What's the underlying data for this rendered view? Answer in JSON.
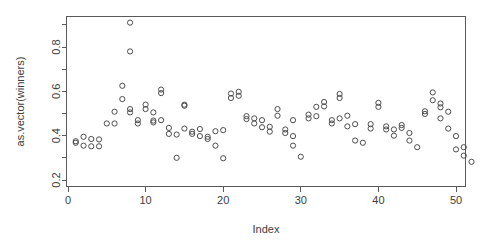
{
  "chart_data": {
    "type": "scatter",
    "title": "",
    "xlabel": "Index",
    "ylabel": "as.vector(winners)",
    "xlim": [
      0,
      53
    ],
    "ylim": [
      0.2,
      0.93
    ],
    "grid": false,
    "legend": null,
    "marker": "open-circle",
    "marker_color": "#4d4d4d",
    "xticks": [
      0,
      10,
      20,
      30,
      40,
      50
    ],
    "xtick_labels": [
      "0",
      "10",
      "20",
      "30",
      "40",
      "50"
    ],
    "yticks": [
      0.2,
      0.4,
      0.6,
      0.8
    ],
    "ytick_labels": [
      "0.2",
      "0.4",
      "0.6",
      "0.8"
    ],
    "yminor_ticks": [
      0.3,
      0.5,
      0.7,
      0.9
    ],
    "points": [
      {
        "x": 1,
        "y": 0.375
      },
      {
        "x": 1,
        "y": 0.368
      },
      {
        "x": 2,
        "y": 0.395
      },
      {
        "x": 2,
        "y": 0.355
      },
      {
        "x": 3,
        "y": 0.385
      },
      {
        "x": 3,
        "y": 0.352
      },
      {
        "x": 4,
        "y": 0.383
      },
      {
        "x": 4,
        "y": 0.352
      },
      {
        "x": 5,
        "y": 0.455
      },
      {
        "x": 6,
        "y": 0.455
      },
      {
        "x": 6,
        "y": 0.508
      },
      {
        "x": 7,
        "y": 0.625
      },
      {
        "x": 7,
        "y": 0.565
      },
      {
        "x": 8,
        "y": 0.91
      },
      {
        "x": 8,
        "y": 0.78
      },
      {
        "x": 8,
        "y": 0.52
      },
      {
        "x": 8,
        "y": 0.505
      },
      {
        "x": 9,
        "y": 0.47
      },
      {
        "x": 9,
        "y": 0.455
      },
      {
        "x": 10,
        "y": 0.52
      },
      {
        "x": 10,
        "y": 0.54
      },
      {
        "x": 11,
        "y": 0.505
      },
      {
        "x": 11,
        "y": 0.468
      },
      {
        "x": 11,
        "y": 0.46
      },
      {
        "x": 12,
        "y": 0.608
      },
      {
        "x": 12,
        "y": 0.592
      },
      {
        "x": 12,
        "y": 0.47
      },
      {
        "x": 13,
        "y": 0.435
      },
      {
        "x": 13,
        "y": 0.408
      },
      {
        "x": 14,
        "y": 0.3
      },
      {
        "x": 14,
        "y": 0.405
      },
      {
        "x": 15,
        "y": 0.54
      },
      {
        "x": 15,
        "y": 0.535
      },
      {
        "x": 15,
        "y": 0.432
      },
      {
        "x": 16,
        "y": 0.418
      },
      {
        "x": 16,
        "y": 0.408
      },
      {
        "x": 17,
        "y": 0.43
      },
      {
        "x": 17,
        "y": 0.398
      },
      {
        "x": 18,
        "y": 0.395
      },
      {
        "x": 18,
        "y": 0.385
      },
      {
        "x": 19,
        "y": 0.355
      },
      {
        "x": 19,
        "y": 0.42
      },
      {
        "x": 20,
        "y": 0.425
      },
      {
        "x": 20,
        "y": 0.298
      },
      {
        "x": 21,
        "y": 0.59
      },
      {
        "x": 21,
        "y": 0.57
      },
      {
        "x": 22,
        "y": 0.598
      },
      {
        "x": 22,
        "y": 0.58
      },
      {
        "x": 23,
        "y": 0.488
      },
      {
        "x": 23,
        "y": 0.475
      },
      {
        "x": 24,
        "y": 0.478
      },
      {
        "x": 24,
        "y": 0.455
      },
      {
        "x": 25,
        "y": 0.47
      },
      {
        "x": 25,
        "y": 0.438
      },
      {
        "x": 26,
        "y": 0.44
      },
      {
        "x": 26,
        "y": 0.418
      },
      {
        "x": 27,
        "y": 0.52
      },
      {
        "x": 27,
        "y": 0.49
      },
      {
        "x": 28,
        "y": 0.428
      },
      {
        "x": 28,
        "y": 0.412
      },
      {
        "x": 29,
        "y": 0.47
      },
      {
        "x": 29,
        "y": 0.398
      },
      {
        "x": 29,
        "y": 0.355
      },
      {
        "x": 30,
        "y": 0.305
      },
      {
        "x": 31,
        "y": 0.495
      },
      {
        "x": 31,
        "y": 0.478
      },
      {
        "x": 32,
        "y": 0.53
      },
      {
        "x": 32,
        "y": 0.488
      },
      {
        "x": 33,
        "y": 0.552
      },
      {
        "x": 33,
        "y": 0.532
      },
      {
        "x": 34,
        "y": 0.47
      },
      {
        "x": 34,
        "y": 0.455
      },
      {
        "x": 35,
        "y": 0.588
      },
      {
        "x": 35,
        "y": 0.57
      },
      {
        "x": 35,
        "y": 0.478
      },
      {
        "x": 36,
        "y": 0.49
      },
      {
        "x": 36,
        "y": 0.442
      },
      {
        "x": 37,
        "y": 0.452
      },
      {
        "x": 37,
        "y": 0.378
      },
      {
        "x": 38,
        "y": 0.368
      },
      {
        "x": 39,
        "y": 0.452
      },
      {
        "x": 39,
        "y": 0.432
      },
      {
        "x": 40,
        "y": 0.548
      },
      {
        "x": 40,
        "y": 0.53
      },
      {
        "x": 41,
        "y": 0.442
      },
      {
        "x": 41,
        "y": 0.428
      },
      {
        "x": 42,
        "y": 0.428
      },
      {
        "x": 42,
        "y": 0.4
      },
      {
        "x": 43,
        "y": 0.435
      },
      {
        "x": 43,
        "y": 0.448
      },
      {
        "x": 44,
        "y": 0.412
      },
      {
        "x": 44,
        "y": 0.378
      },
      {
        "x": 45,
        "y": 0.348
      },
      {
        "x": 46,
        "y": 0.51
      },
      {
        "x": 46,
        "y": 0.498
      },
      {
        "x": 47,
        "y": 0.595
      },
      {
        "x": 47,
        "y": 0.56
      },
      {
        "x": 48,
        "y": 0.545
      },
      {
        "x": 48,
        "y": 0.528
      },
      {
        "x": 48,
        "y": 0.478
      },
      {
        "x": 49,
        "y": 0.508
      },
      {
        "x": 49,
        "y": 0.432
      },
      {
        "x": 50,
        "y": 0.398
      },
      {
        "x": 50,
        "y": 0.338
      },
      {
        "x": 51,
        "y": 0.348
      },
      {
        "x": 51,
        "y": 0.31
      },
      {
        "x": 52,
        "y": 0.282
      }
    ]
  }
}
